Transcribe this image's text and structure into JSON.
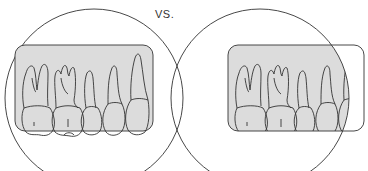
{
  "diagram": {
    "separator_label": "VS.",
    "panels": [
      {
        "name": "film-centered-in-beam",
        "description": "Film rectangle fully inside circular beam"
      },
      {
        "name": "film-offset-from-beam",
        "description": "Film rectangle shifted, partially outside circular beam (cone cut)"
      }
    ],
    "colors": {
      "film_fill": "#dcdcdc",
      "outline": "#333333",
      "background": "#ffffff"
    }
  }
}
